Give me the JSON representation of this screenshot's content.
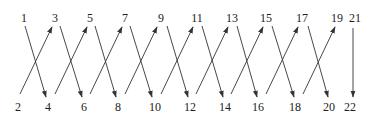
{
  "diagram": {
    "title": "",
    "colors": {
      "stroke": "#333333",
      "text": "#222222",
      "background": "#ffffff"
    },
    "nodes": [
      {
        "id": "1",
        "label": "1",
        "x": 24,
        "y": 22
      },
      {
        "id": "3",
        "label": "3",
        "x": 55,
        "y": 22
      },
      {
        "id": "5",
        "label": "5",
        "x": 90,
        "y": 22
      },
      {
        "id": "7",
        "label": "7",
        "x": 125,
        "y": 22
      },
      {
        "id": "9",
        "label": "9",
        "x": 161,
        "y": 22
      },
      {
        "id": "11",
        "label": "11",
        "x": 197,
        "y": 22
      },
      {
        "id": "13",
        "label": "13",
        "x": 232,
        "y": 22
      },
      {
        "id": "15",
        "label": "15",
        "x": 266,
        "y": 22
      },
      {
        "id": "17",
        "label": "17",
        "x": 302,
        "y": 22
      },
      {
        "id": "19",
        "label": "19",
        "x": 337,
        "y": 22
      },
      {
        "id": "21",
        "label": "21",
        "x": 355,
        "y": 22
      },
      {
        "id": "2",
        "label": "2",
        "x": 18,
        "y": 111
      },
      {
        "id": "4",
        "label": "4",
        "x": 48,
        "y": 111
      },
      {
        "id": "6",
        "label": "6",
        "x": 84,
        "y": 111
      },
      {
        "id": "8",
        "label": "8",
        "x": 118,
        "y": 111
      },
      {
        "id": "10",
        "label": "10",
        "x": 155,
        "y": 111
      },
      {
        "id": "12",
        "label": "12",
        "x": 190,
        "y": 111
      },
      {
        "id": "14",
        "label": "14",
        "x": 225,
        "y": 111
      },
      {
        "id": "16",
        "label": "16",
        "x": 258,
        "y": 111
      },
      {
        "id": "18",
        "label": "18",
        "x": 295,
        "y": 111
      },
      {
        "id": "20",
        "label": "20",
        "x": 329,
        "y": 111
      },
      {
        "id": "22",
        "label": "22",
        "x": 350,
        "y": 111
      }
    ],
    "edges": [
      {
        "from": "1",
        "to": "4",
        "x1": 25,
        "y1": 26,
        "x2": 46,
        "y2": 97
      },
      {
        "from": "2",
        "to": "3",
        "x1": 20,
        "y1": 94,
        "x2": 52,
        "y2": 27
      },
      {
        "from": "3",
        "to": "6",
        "x1": 60,
        "y1": 26,
        "x2": 82,
        "y2": 97
      },
      {
        "from": "4",
        "to": "5",
        "x1": 55,
        "y1": 94,
        "x2": 87,
        "y2": 27
      },
      {
        "from": "5",
        "to": "8",
        "x1": 95,
        "y1": 26,
        "x2": 116,
        "y2": 97
      },
      {
        "from": "6",
        "to": "7",
        "x1": 90,
        "y1": 94,
        "x2": 122,
        "y2": 27
      },
      {
        "from": "7",
        "to": "10",
        "x1": 130,
        "y1": 26,
        "x2": 152,
        "y2": 97
      },
      {
        "from": "8",
        "to": "9",
        "x1": 125,
        "y1": 94,
        "x2": 157,
        "y2": 27
      },
      {
        "from": "9",
        "to": "12",
        "x1": 167,
        "y1": 26,
        "x2": 188,
        "y2": 97
      },
      {
        "from": "10",
        "to": "11",
        "x1": 161,
        "y1": 94,
        "x2": 193,
        "y2": 27
      },
      {
        "from": "11",
        "to": "14",
        "x1": 202,
        "y1": 26,
        "x2": 223,
        "y2": 97
      },
      {
        "from": "12",
        "to": "13",
        "x1": 196,
        "y1": 94,
        "x2": 228,
        "y2": 27
      },
      {
        "from": "13",
        "to": "16",
        "x1": 237,
        "y1": 26,
        "x2": 257,
        "y2": 97
      },
      {
        "from": "14",
        "to": "15",
        "x1": 231,
        "y1": 94,
        "x2": 263,
        "y2": 27
      },
      {
        "from": "15",
        "to": "18",
        "x1": 272,
        "y1": 26,
        "x2": 294,
        "y2": 97
      },
      {
        "from": "16",
        "to": "17",
        "x1": 266,
        "y1": 94,
        "x2": 298,
        "y2": 27
      },
      {
        "from": "17",
        "to": "20",
        "x1": 308,
        "y1": 26,
        "x2": 328,
        "y2": 97
      },
      {
        "from": "18",
        "to": "19",
        "x1": 303,
        "y1": 94,
        "x2": 335,
        "y2": 27
      },
      {
        "from": "21",
        "to": "22",
        "x1": 353,
        "y1": 28,
        "x2": 353,
        "y2": 97
      }
    ]
  }
}
